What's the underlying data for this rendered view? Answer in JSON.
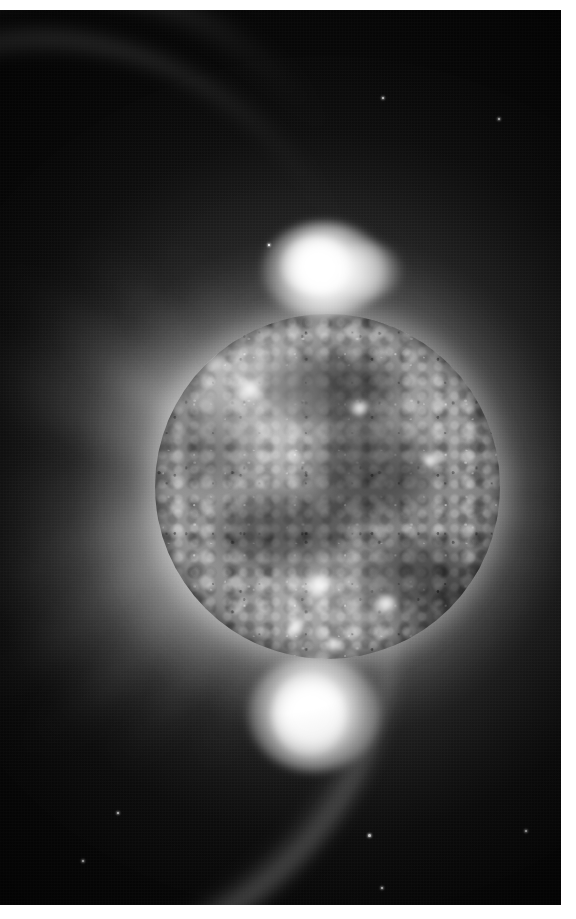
{
  "image": {
    "subject": "Sun",
    "title": "Solar corona and disk in extreme ultraviolet",
    "caption": "Full-disk solar image showing the mottled chromospheric network, bright polar prominences and radial coronal streamers against black space",
    "rendering": "grayscale",
    "orientation": "portrait",
    "width_px": 576,
    "height_px": 919,
    "border": {
      "color": "#ffffff",
      "top_px": 10,
      "right_px": 15,
      "bottom_px": 14,
      "left_px": 0
    },
    "alt_text": "Black and white photograph of the Sun. A textured grey solar disk fills the centre of the frame, surrounded by feathery white coronal streamers radiating outward, with intensely bright prominences erupting from the top and bottom of the disk."
  },
  "palette": {
    "space_black": "#050505",
    "deep_black": "#030303",
    "corona_grey": "#bfbfbf",
    "disk_mid_grey": "#8c8c8c",
    "disk_light_grey": "#b8b8b8",
    "disk_dark_grey": "#5f5f5f",
    "highlight_white": "#ffffff",
    "frame_white": "#ffffff"
  },
  "disk": {
    "label": "solar-disk",
    "center_x": 327,
    "center_y": 486,
    "radius_px": 172,
    "description": "Granular, mottled photospheric/chromospheric surface with darker filament channels and scattered bright plages"
  },
  "features": [
    {
      "name": "north-polar-prominence",
      "label": "Bright prominence above the north limb",
      "x": 322,
      "y": 272,
      "size": 120,
      "intensity": 1.0
    },
    {
      "name": "south-polar-prominence",
      "label": "Bright prominence below the south limb",
      "x": 313,
      "y": 710,
      "size": 118,
      "intensity": 0.98
    },
    {
      "name": "northwest-coronal-fan",
      "label": "Sweeping fan of coronal loops to the upper left",
      "intensity": 0.7
    },
    {
      "name": "east-limb-streamers",
      "label": "Radial streamers off the right limb",
      "intensity": 0.8
    },
    {
      "name": "southwest-streamers",
      "label": "Long streaky rays to the lower left",
      "intensity": 0.65
    },
    {
      "name": "northeast-dark-region",
      "label": "Dark, nearly featureless sky in the upper right corner",
      "intensity": 0.05
    }
  ],
  "rays": [
    {
      "angle": -158,
      "length": 420,
      "width": 78,
      "alpha": 0.52,
      "blur": 16
    },
    {
      "angle": -146,
      "length": 400,
      "width": 56,
      "alpha": 0.58,
      "blur": 13
    },
    {
      "angle": -134,
      "length": 360,
      "width": 44,
      "alpha": 0.5,
      "blur": 12
    },
    {
      "angle": -122,
      "length": 300,
      "width": 40,
      "alpha": 0.44,
      "blur": 12
    },
    {
      "angle": -108,
      "length": 230,
      "width": 46,
      "alpha": 0.34,
      "blur": 14
    },
    {
      "angle": -96,
      "length": 190,
      "width": 52,
      "alpha": 0.26,
      "blur": 16
    },
    {
      "angle": -78,
      "length": 150,
      "width": 46,
      "alpha": 0.16,
      "blur": 16
    },
    {
      "angle": -60,
      "length": 130,
      "width": 44,
      "alpha": 0.12,
      "blur": 16
    },
    {
      "angle": -38,
      "length": 150,
      "width": 40,
      "alpha": 0.14,
      "blur": 15
    },
    {
      "angle": -18,
      "length": 210,
      "width": 44,
      "alpha": 0.36,
      "blur": 12
    },
    {
      "angle": -6,
      "length": 250,
      "width": 40,
      "alpha": 0.62,
      "blur": 10
    },
    {
      "angle": 6,
      "length": 255,
      "width": 36,
      "alpha": 0.66,
      "blur": 9
    },
    {
      "angle": 18,
      "length": 245,
      "width": 34,
      "alpha": 0.58,
      "blur": 9
    },
    {
      "angle": 30,
      "length": 235,
      "width": 32,
      "alpha": 0.52,
      "blur": 10
    },
    {
      "angle": 42,
      "length": 225,
      "width": 34,
      "alpha": 0.48,
      "blur": 11
    },
    {
      "angle": 56,
      "length": 210,
      "width": 40,
      "alpha": 0.42,
      "blur": 12
    },
    {
      "angle": 70,
      "length": 200,
      "width": 46,
      "alpha": 0.4,
      "blur": 13
    },
    {
      "angle": 86,
      "length": 215,
      "width": 50,
      "alpha": 0.46,
      "blur": 13
    },
    {
      "angle": 100,
      "length": 250,
      "width": 48,
      "alpha": 0.5,
      "blur": 13
    },
    {
      "angle": 114,
      "length": 300,
      "width": 46,
      "alpha": 0.52,
      "blur": 13
    },
    {
      "angle": 128,
      "length": 350,
      "width": 44,
      "alpha": 0.54,
      "blur": 13
    },
    {
      "angle": 140,
      "length": 400,
      "width": 50,
      "alpha": 0.56,
      "blur": 14
    },
    {
      "angle": 152,
      "length": 430,
      "width": 60,
      "alpha": 0.52,
      "blur": 15
    },
    {
      "angle": 164,
      "length": 430,
      "width": 70,
      "alpha": 0.44,
      "blur": 17
    },
    {
      "angle": 176,
      "length": 400,
      "width": 80,
      "alpha": 0.36,
      "blur": 19
    }
  ],
  "specks": [
    {
      "x": 368,
      "y": 834,
      "size": 3
    },
    {
      "x": 381,
      "y": 887,
      "size": 2
    },
    {
      "x": 525,
      "y": 830,
      "size": 2
    },
    {
      "x": 117,
      "y": 812,
      "size": 2
    },
    {
      "x": 82,
      "y": 860,
      "size": 2
    },
    {
      "x": 498,
      "y": 118,
      "size": 2
    },
    {
      "x": 382,
      "y": 97,
      "size": 2
    },
    {
      "x": 268,
      "y": 244,
      "size": 2
    }
  ],
  "plages": [
    {
      "x": 318,
      "y": 596,
      "w": 34,
      "h": 24
    },
    {
      "x": 386,
      "y": 614,
      "w": 26,
      "h": 20
    },
    {
      "x": 296,
      "y": 636,
      "w": 24,
      "h": 16
    },
    {
      "x": 250,
      "y": 400,
      "w": 30,
      "h": 22
    },
    {
      "x": 214,
      "y": 372,
      "w": 26,
      "h": 18
    },
    {
      "x": 360,
      "y": 418,
      "w": 22,
      "h": 16
    },
    {
      "x": 430,
      "y": 470,
      "w": 20,
      "h": 15
    },
    {
      "x": 333,
      "y": 654,
      "w": 22,
      "h": 13
    }
  ]
}
